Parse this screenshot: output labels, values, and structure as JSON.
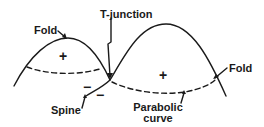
{
  "diagram": {
    "labels": {
      "fold_left": "Fold",
      "fold_right": "Fold",
      "t_junction": "T-junction",
      "spine": "Spine",
      "parabolic_line1": "Parabolic",
      "parabolic_line2": "curve"
    },
    "signs": {
      "left_region": "+",
      "right_region": "+",
      "minus_upper": "−",
      "minus_lower": "−"
    },
    "colors": {
      "ink": "#1a1a1a",
      "background": "#ffffff"
    }
  }
}
